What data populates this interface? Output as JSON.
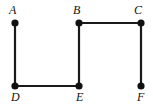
{
  "diagram": {
    "type": "undirected-graph",
    "title": "",
    "canvas": {
      "width": 153,
      "height": 108,
      "background": "#ffffff"
    },
    "style": {
      "edge_color": "#1a1a1a",
      "edge_width": 2.2,
      "vertex_fill": "#111111",
      "vertex_radius": 3.6,
      "label_color": "#141414",
      "label_font_size": 12,
      "label_style": "italic-serif"
    },
    "vertices": [
      {
        "id": "A",
        "label": "A",
        "x": 15,
        "y": 23,
        "label_x": 9,
        "label_y": 4,
        "label_position": "above-left"
      },
      {
        "id": "B",
        "label": "B",
        "x": 79,
        "y": 23,
        "label_x": 73,
        "label_y": 4,
        "label_position": "above-left"
      },
      {
        "id": "C",
        "label": "C",
        "x": 141,
        "y": 23,
        "label_x": 134,
        "label_y": 4,
        "label_position": "above-left"
      },
      {
        "id": "D",
        "label": "D",
        "x": 15,
        "y": 86,
        "label_x": 11,
        "label_y": 91,
        "label_position": "below-left"
      },
      {
        "id": "E",
        "label": "E",
        "x": 79,
        "y": 86,
        "label_x": 76,
        "label_y": 91,
        "label_position": "below-left"
      },
      {
        "id": "F",
        "label": "F",
        "x": 141,
        "y": 86,
        "label_x": 137,
        "label_y": 91,
        "label_position": "below-left"
      }
    ],
    "edges": [
      {
        "id": "edge-A-D",
        "from": "A",
        "to": "D",
        "x1": 15,
        "y1": 23,
        "x2": 15,
        "y2": 86
      },
      {
        "id": "edge-D-E",
        "from": "D",
        "to": "E",
        "x1": 15,
        "y1": 86,
        "x2": 79,
        "y2": 86
      },
      {
        "id": "edge-B-E",
        "from": "B",
        "to": "E",
        "x1": 79,
        "y1": 23,
        "x2": 79,
        "y2": 86
      },
      {
        "id": "edge-B-C",
        "from": "B",
        "to": "C",
        "x1": 79,
        "y1": 23,
        "x2": 141,
        "y2": 23
      },
      {
        "id": "edge-C-F",
        "from": "C",
        "to": "F",
        "x1": 141,
        "y1": 23,
        "x2": 141,
        "y2": 86
      }
    ]
  }
}
